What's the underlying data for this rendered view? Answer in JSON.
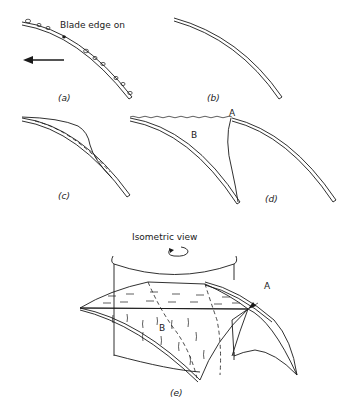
{
  "figure": {
    "panels": [
      {
        "id": "a",
        "label": "(a)",
        "annotation": "Blade edge on"
      },
      {
        "id": "b",
        "label": "(b)"
      },
      {
        "id": "c",
        "label": "(c)"
      },
      {
        "id": "d",
        "label": "(d)",
        "markers": [
          "A",
          "B"
        ]
      },
      {
        "id": "e",
        "label": "(e)",
        "annotation": "Isometric view",
        "markers": [
          "A",
          "B"
        ]
      }
    ],
    "labels": {
      "blade_edge_on": "Blade edge on",
      "isometric_view": "Isometric view",
      "a": "(a)",
      "b": "(b)",
      "c": "(c)",
      "d": "(d)",
      "e": "(e)",
      "marker_A": "A",
      "marker_B": "B"
    },
    "colors": {
      "ink": "#1a1a1a",
      "background": "#ffffff"
    }
  }
}
